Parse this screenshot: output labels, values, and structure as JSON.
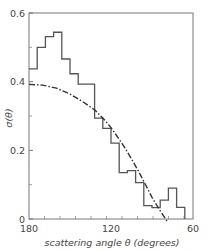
{
  "chart_data": {
    "type": "line",
    "title": "",
    "xlabel": "scattering angle θ (degrees)",
    "ylabel": "σ(θ)",
    "xlim": [
      180,
      60
    ],
    "ylim": [
      0,
      0.6
    ],
    "x_reversed": true,
    "grid": false,
    "legend": null,
    "xticks": [
      180,
      120,
      60
    ],
    "xtick_labels": [
      "180",
      "120",
      "60"
    ],
    "x_minor_tick_step": 11.4,
    "yticks": [
      0,
      0.2,
      0.4,
      0.6
    ],
    "ytick_labels": [
      "0",
      "0.2",
      "0.4",
      "0.6"
    ],
    "y_minor_ticks": [
      0.1,
      0.3,
      0.5
    ],
    "series": [
      {
        "name": "histogram",
        "style": "step",
        "bin_edges": [
          180,
          174,
          168,
          162,
          156,
          150,
          144,
          138,
          132,
          126,
          120,
          114,
          108,
          102,
          96,
          90,
          84,
          78,
          72,
          66
        ],
        "values": [
          0.437,
          0.5,
          0.531,
          0.544,
          0.466,
          0.423,
          0.393,
          0.393,
          0.294,
          0.264,
          0.221,
          0.135,
          0.141,
          0.106,
          0.039,
          0.033,
          0.055,
          0.09,
          0.034
        ]
      },
      {
        "name": "theory curve",
        "style": "dash-dot",
        "x": [
          180,
          170,
          160,
          150,
          140,
          132,
          125,
          120,
          115,
          110,
          105,
          100,
          95,
          90,
          85,
          80
        ],
        "values": [
          0.392,
          0.39,
          0.381,
          0.364,
          0.34,
          0.318,
          0.29,
          0.266,
          0.238,
          0.208,
          0.175,
          0.14,
          0.102,
          0.063,
          0.03,
          0.0
        ]
      }
    ]
  }
}
